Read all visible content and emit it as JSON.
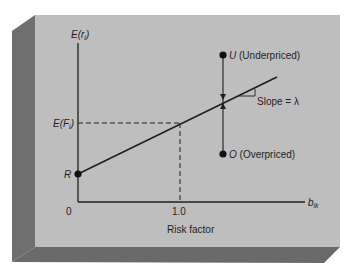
{
  "diagram": {
    "y_axis_label": {
      "main": "E(r",
      "sub": "i",
      "close": ")"
    },
    "x_axis_label": {
      "main": "b",
      "sub": "ik"
    },
    "ef_label": {
      "main": "E(F",
      "sub": "i",
      "close": ")"
    },
    "r_label": "R",
    "origin_label": "0",
    "tick_label": "1.0",
    "x_title": "Risk factor",
    "u_label": {
      "letter": "U",
      "text": " (Underpriced)"
    },
    "o_label": {
      "letter": "O",
      "text": " (Overpriced)"
    },
    "slope_label": "Slope = λ"
  },
  "colors": {
    "panel_face": "#bebebe",
    "panel_side": "#6f6f6f",
    "panel_bottom": "#6a6a6a",
    "ink": "#1e1e1e"
  }
}
